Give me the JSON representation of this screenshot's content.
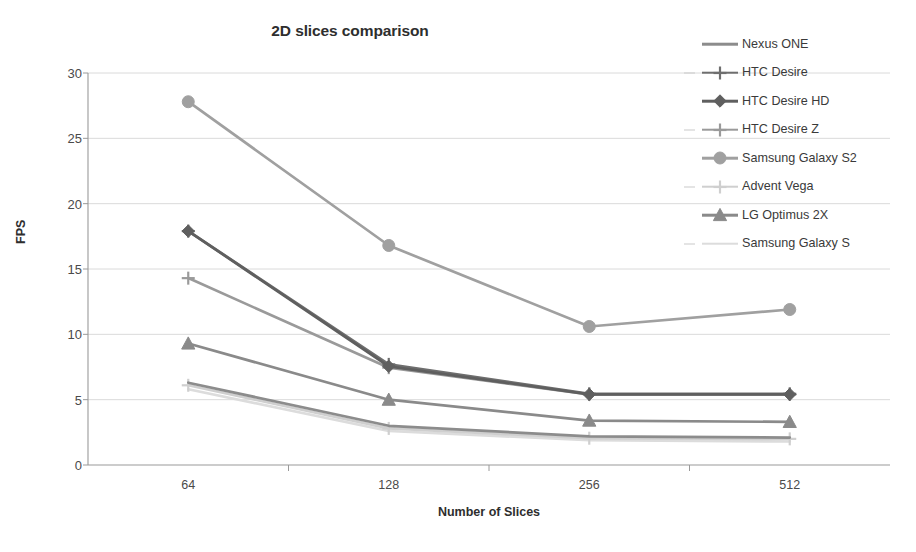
{
  "chart_data": {
    "type": "line",
    "title": "2D slices comparison",
    "xlabel": "Number of Slices",
    "ylabel": "FPS",
    "categories": [
      "64",
      "128",
      "256",
      "512"
    ],
    "x": [
      64,
      128,
      256,
      512
    ],
    "ylim": [
      0,
      30
    ],
    "yticks": [
      0,
      5,
      10,
      15,
      20,
      25,
      30
    ],
    "grid": true,
    "legend_position": "right",
    "series": [
      {
        "name": "Nexus ONE",
        "values": [
          6.3,
          3.0,
          2.2,
          2.1
        ],
        "color": "#8c8c8c",
        "marker": "none"
      },
      {
        "name": "HTC Desire",
        "values": [
          17.9,
          7.7,
          5.45,
          5.45
        ],
        "color": "#6e6e6e",
        "marker": "plus"
      },
      {
        "name": "HTC Desire HD",
        "values": [
          17.9,
          7.55,
          5.4,
          5.4
        ],
        "color": "#5f5f5f",
        "marker": "diamond"
      },
      {
        "name": "HTC Desire Z",
        "values": [
          14.3,
          7.45,
          5.4,
          5.4
        ],
        "color": "#9a9a9a",
        "marker": "plus"
      },
      {
        "name": "Samsung Galaxy S2",
        "values": [
          27.8,
          16.8,
          10.6,
          11.9
        ],
        "color": "#a0a0a0",
        "marker": "circle"
      },
      {
        "name": "Advent Vega",
        "values": [
          6.1,
          2.8,
          2.05,
          2.0
        ],
        "color": "#cfcfcf",
        "marker": "plus"
      },
      {
        "name": "LG Optimus 2X",
        "values": [
          9.3,
          5.0,
          3.4,
          3.3
        ],
        "color": "#8a8a8a",
        "marker": "triangle"
      },
      {
        "name": "Samsung Galaxy S",
        "values": [
          5.8,
          2.6,
          1.9,
          1.8
        ],
        "color": "#dcdcdc",
        "marker": "none"
      }
    ]
  },
  "legend": {
    "items": [
      {
        "label": "Nexus ONE"
      },
      {
        "label": "HTC Desire"
      },
      {
        "label": "HTC Desire HD"
      },
      {
        "label": "HTC Desire Z"
      },
      {
        "label": "Samsung Galaxy S2"
      },
      {
        "label": "Advent Vega"
      },
      {
        "label": "LG Optimus 2X"
      },
      {
        "label": "Samsung Galaxy S"
      }
    ]
  },
  "axis": {
    "y_title": "FPS",
    "x_title": "Number of Slices",
    "y_tick_labels": [
      "30",
      "25",
      "20",
      "15",
      "10",
      "5",
      "0"
    ],
    "x_tick_labels": [
      "64",
      "128",
      "256",
      "512"
    ]
  },
  "title": "2D slices comparison"
}
